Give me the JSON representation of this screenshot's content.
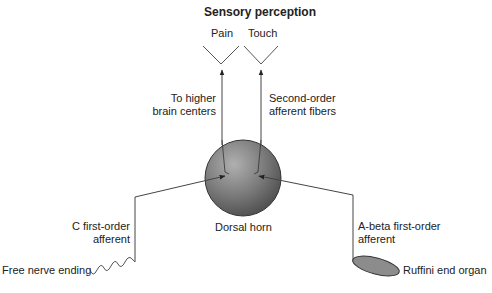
{
  "title": "Sensory perception",
  "perceptions": [
    "Pain",
    "Touch"
  ],
  "labels": {
    "to_higher": [
      "To higher",
      "brain centers"
    ],
    "second_order": [
      "Second-order",
      "afferent fibers"
    ],
    "dorsal_horn": "Dorsal horn",
    "c_afferent": [
      "C first-order",
      "afferent"
    ],
    "abeta_afferent": [
      "A-beta first-order",
      "afferent"
    ],
    "free_nerve": "Free nerve ending",
    "ruffini": "Ruffini end organ"
  },
  "colors": {
    "line": "#4a4a4a",
    "sphere_light": "#9a9a9a",
    "sphere_dark": "#555555",
    "ellipse": "#8c8c8c"
  }
}
